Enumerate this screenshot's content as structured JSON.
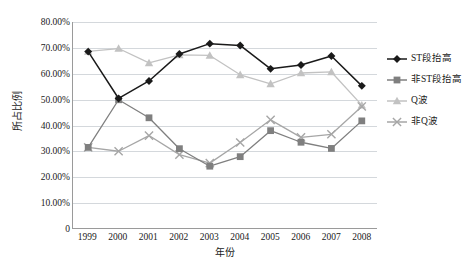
{
  "chart_data": {
    "type": "line",
    "title": "",
    "xlabel": "年份",
    "ylabel": "所占比例",
    "categories": [
      "1999",
      "2000",
      "2001",
      "2002",
      "2003",
      "2004",
      "2005",
      "2006",
      "2007",
      "2008"
    ],
    "ylim": [
      0,
      80
    ],
    "yticks": [
      "0",
      "10.00%",
      "20.00%",
      "30.00%",
      "40.00%",
      "50.00%",
      "60.00%",
      "70.00%",
      "80.00%"
    ],
    "ytick_values": [
      0,
      10,
      20,
      30,
      40,
      50,
      60,
      70,
      80
    ],
    "grid": true,
    "legend_position": "right",
    "series": [
      {
        "name": "ST段抬高",
        "color": "#1a1a1a",
        "marker": "diamond",
        "values": [
          68.5,
          50.3,
          57.1,
          67.6,
          71.6,
          70.9,
          61.8,
          63.3,
          66.8,
          55.2
        ]
      },
      {
        "name": "非ST段抬高",
        "color": "#7f7f7f",
        "marker": "square",
        "values": [
          31.3,
          49.8,
          42.8,
          30.8,
          24.0,
          27.7,
          37.8,
          33.3,
          30.9,
          41.6
        ]
      },
      {
        "name": "Q波",
        "color": "#c2c2c2",
        "marker": "triangle",
        "values": [
          68.6,
          69.7,
          64.1,
          67.2,
          67.0,
          59.5,
          56.0,
          60.2,
          60.6,
          47.7
        ]
      },
      {
        "name": "非Q波",
        "color": "#a6a6a6",
        "marker": "cross",
        "values": [
          31.3,
          29.8,
          35.9,
          28.5,
          25.2,
          33.2,
          42.0,
          35.2,
          36.4,
          47.2
        ]
      }
    ]
  }
}
